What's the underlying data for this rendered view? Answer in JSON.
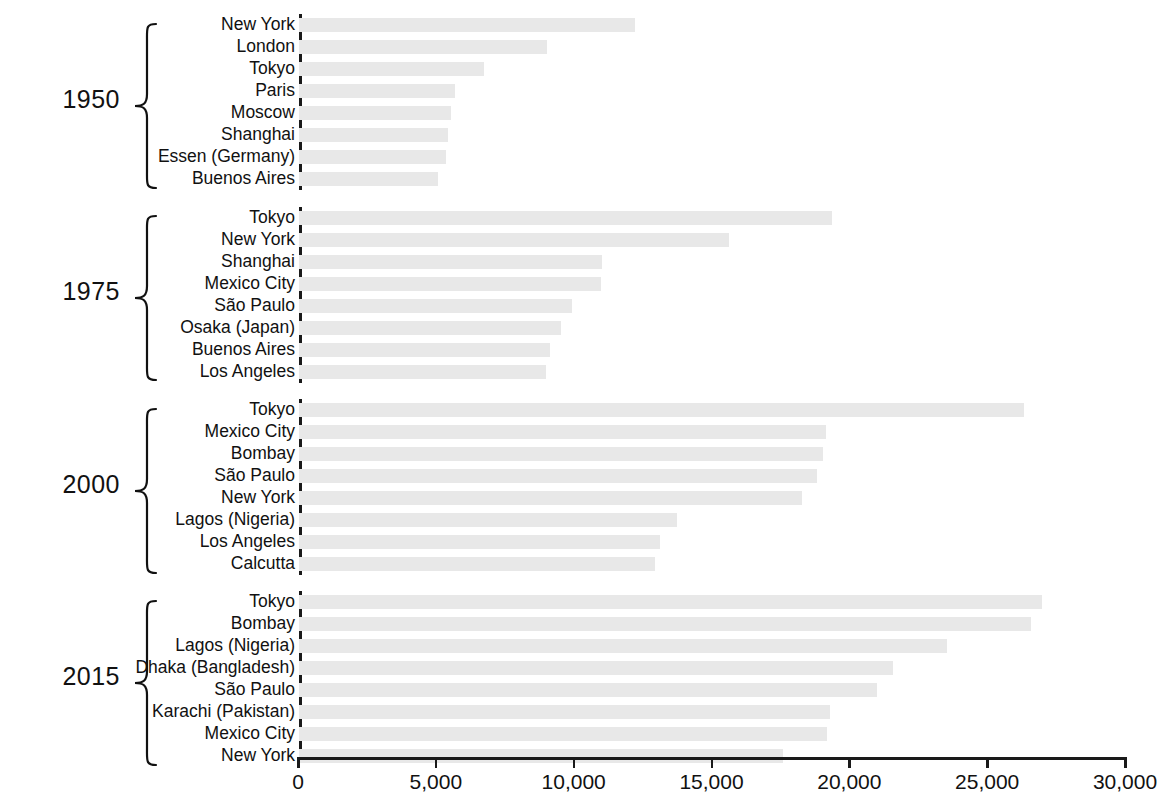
{
  "chart_data": {
    "type": "bar",
    "orientation": "horizontal",
    "title": "",
    "subtitle": "",
    "xlabel": "",
    "ylabel": "",
    "xlim": [
      0,
      30000
    ],
    "grid": false,
    "legend": null,
    "bar_color": "#e8e8e8",
    "axis_color": "#1a1a1a",
    "xticks": [
      0,
      5000,
      10000,
      15000,
      20000,
      25000,
      30000
    ],
    "xticklabels": [
      "0",
      "5,000",
      "10,000",
      "15,000",
      "20,000",
      "25,000",
      "30,000"
    ],
    "groups": [
      {
        "label": "1950",
        "categories": [
          "New York",
          "London",
          "Tokyo",
          "Paris",
          "Moscow",
          "Shanghai",
          "Essen (Germany)",
          "Buenos Aires"
        ],
        "values": [
          12200,
          9000,
          6700,
          5650,
          5500,
          5400,
          5350,
          5050
        ]
      },
      {
        "label": "1975",
        "categories": [
          "Tokyo",
          "New York",
          "Shanghai",
          "Mexico City",
          "São Paulo",
          "Osaka (Japan)",
          "Buenos Aires",
          "Los Angeles"
        ],
        "values": [
          19350,
          15600,
          11000,
          10950,
          9900,
          9500,
          9100,
          8950
        ]
      },
      {
        "label": "2000",
        "categories": [
          "Tokyo",
          "Mexico City",
          "Bombay",
          "São Paulo",
          "New York",
          "Lagos (Nigeria)",
          "Los Angeles",
          "Calcutta"
        ],
        "values": [
          26300,
          19100,
          19000,
          18800,
          18250,
          13700,
          13100,
          12900
        ]
      },
      {
        "label": "2015",
        "categories": [
          "Tokyo",
          "Bombay",
          "Lagos (Nigeria)",
          "Dhaka (Bangladesh)",
          "São Paulo",
          "Karachi (Pakistan)",
          "Mexico City",
          "New York"
        ],
        "values": [
          26950,
          26550,
          23500,
          21550,
          20950,
          19250,
          19150,
          17550
        ]
      }
    ]
  }
}
